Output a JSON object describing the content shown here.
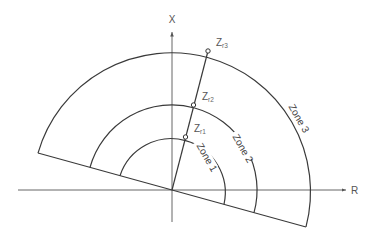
{
  "diagram": {
    "axes": {
      "x_label": "X",
      "r_label": "R"
    },
    "points": [
      {
        "name": "Z",
        "subscript": "r1"
      },
      {
        "name": "Z",
        "subscript": "r2"
      },
      {
        "name": "Z",
        "subscript": "r3"
      }
    ],
    "zones": [
      {
        "label": "Zone 1"
      },
      {
        "label": "Zone 2"
      },
      {
        "label": "Zone 3"
      }
    ],
    "colors": {
      "line": "#3a3a3a",
      "axis": "#555555",
      "text": "#555555"
    }
  }
}
